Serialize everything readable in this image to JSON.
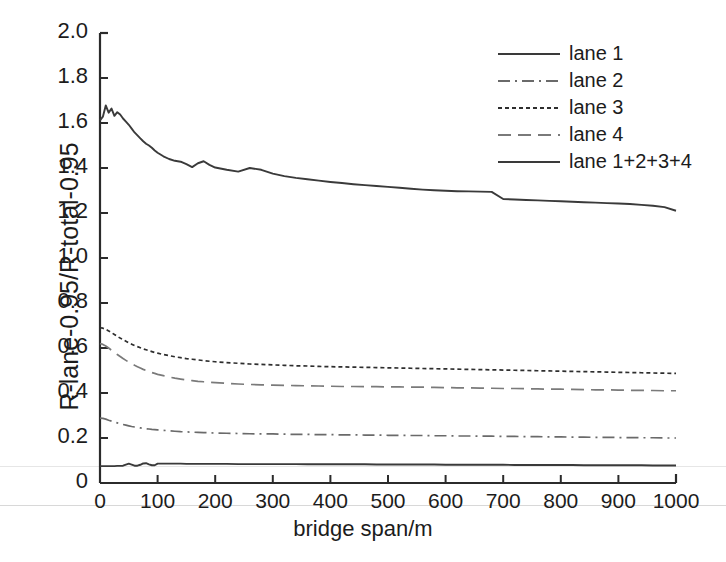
{
  "chart_data": {
    "type": "line",
    "title": "",
    "xlabel": "bridge span/m",
    "ylabel": "R-lane-0.95/R-total-0.95",
    "xlim": [
      0,
      1000
    ],
    "ylim": [
      0,
      2.0
    ],
    "grid": false,
    "legend_position": "upper right",
    "xticks": [
      "0",
      "100",
      "200",
      "300",
      "400",
      "500",
      "600",
      "700",
      "800",
      "900",
      "1000"
    ],
    "xtick_values": [
      0,
      100,
      200,
      300,
      400,
      500,
      600,
      700,
      800,
      900,
      1000
    ],
    "yticks": [
      "0",
      "0.2",
      "0.4",
      "0.6",
      "0.8",
      "1.0",
      "1.2",
      "1.4",
      "1.6",
      "1.8",
      "2.0"
    ],
    "ytick_values": [
      0,
      0.2,
      0.4,
      0.6,
      0.8,
      1.0,
      1.2,
      1.4,
      1.6,
      1.8,
      2.0
    ],
    "x": [
      0,
      5,
      10,
      15,
      20,
      25,
      30,
      35,
      40,
      45,
      50,
      55,
      60,
      65,
      70,
      75,
      80,
      85,
      90,
      95,
      100,
      110,
      120,
      130,
      140,
      150,
      160,
      170,
      180,
      190,
      200,
      220,
      240,
      260,
      280,
      300,
      320,
      340,
      360,
      380,
      400,
      420,
      440,
      460,
      480,
      500,
      520,
      540,
      560,
      580,
      600,
      620,
      640,
      660,
      680,
      700,
      720,
      740,
      760,
      780,
      800,
      820,
      840,
      860,
      880,
      900,
      920,
      940,
      960,
      980,
      1000
    ],
    "series": [
      {
        "name": "lane 1",
        "style": "solid",
        "color": "#3a3a3a",
        "values": [
          0.075,
          0.075,
          0.075,
          0.075,
          0.075,
          0.075,
          0.076,
          0.076,
          0.077,
          0.082,
          0.086,
          0.082,
          0.077,
          0.077,
          0.081,
          0.087,
          0.088,
          0.083,
          0.079,
          0.079,
          0.086,
          0.086,
          0.086,
          0.086,
          0.086,
          0.085,
          0.085,
          0.085,
          0.085,
          0.085,
          0.085,
          0.085,
          0.084,
          0.084,
          0.084,
          0.084,
          0.084,
          0.084,
          0.083,
          0.083,
          0.083,
          0.083,
          0.083,
          0.083,
          0.082,
          0.082,
          0.082,
          0.082,
          0.082,
          0.082,
          0.081,
          0.081,
          0.081,
          0.081,
          0.081,
          0.081,
          0.08,
          0.08,
          0.08,
          0.08,
          0.08,
          0.08,
          0.079,
          0.079,
          0.079,
          0.079,
          0.079,
          0.079,
          0.078,
          0.078,
          0.078
        ]
      },
      {
        "name": "lane 2",
        "style": "dashdot",
        "color": "#6a6a6a",
        "values": [
          0.288,
          0.287,
          0.284,
          0.279,
          0.275,
          0.271,
          0.267,
          0.263,
          0.26,
          0.257,
          0.254,
          0.251,
          0.249,
          0.247,
          0.245,
          0.243,
          0.241,
          0.24,
          0.238,
          0.237,
          0.236,
          0.234,
          0.232,
          0.23,
          0.228,
          0.227,
          0.226,
          0.225,
          0.224,
          0.223,
          0.222,
          0.221,
          0.22,
          0.219,
          0.218,
          0.218,
          0.217,
          0.216,
          0.216,
          0.215,
          0.215,
          0.214,
          0.214,
          0.213,
          0.213,
          0.212,
          0.212,
          0.211,
          0.211,
          0.21,
          0.21,
          0.209,
          0.209,
          0.208,
          0.208,
          0.207,
          0.207,
          0.206,
          0.206,
          0.205,
          0.205,
          0.204,
          0.204,
          0.203,
          0.203,
          0.202,
          0.202,
          0.201,
          0.201,
          0.2,
          0.2
        ]
      },
      {
        "name": "lane 3",
        "style": "dotted",
        "color": "#2e2e2e",
        "values": [
          0.69,
          0.688,
          0.683,
          0.676,
          0.668,
          0.66,
          0.652,
          0.644,
          0.637,
          0.63,
          0.623,
          0.617,
          0.611,
          0.606,
          0.601,
          0.596,
          0.592,
          0.588,
          0.584,
          0.58,
          0.577,
          0.571,
          0.566,
          0.561,
          0.557,
          0.553,
          0.55,
          0.547,
          0.544,
          0.541,
          0.539,
          0.535,
          0.532,
          0.529,
          0.527,
          0.525,
          0.523,
          0.521,
          0.52,
          0.518,
          0.517,
          0.516,
          0.515,
          0.514,
          0.513,
          0.512,
          0.511,
          0.51,
          0.509,
          0.508,
          0.507,
          0.506,
          0.505,
          0.504,
          0.503,
          0.502,
          0.501,
          0.5,
          0.499,
          0.498,
          0.497,
          0.496,
          0.495,
          0.494,
          0.493,
          0.492,
          0.491,
          0.49,
          0.489,
          0.488,
          0.487
        ]
      },
      {
        "name": "lane 4",
        "style": "dashed",
        "color": "#7a7a7a",
        "values": [
          0.62,
          0.616,
          0.609,
          0.6,
          0.59,
          0.58,
          0.571,
          0.562,
          0.553,
          0.545,
          0.537,
          0.53,
          0.523,
          0.517,
          0.511,
          0.505,
          0.5,
          0.495,
          0.491,
          0.487,
          0.483,
          0.477,
          0.471,
          0.466,
          0.462,
          0.458,
          0.455,
          0.452,
          0.45,
          0.448,
          0.446,
          0.443,
          0.44,
          0.438,
          0.436,
          0.435,
          0.434,
          0.433,
          0.432,
          0.431,
          0.43,
          0.429,
          0.429,
          0.428,
          0.428,
          0.427,
          0.427,
          0.426,
          0.426,
          0.425,
          0.424,
          0.423,
          0.423,
          0.422,
          0.421,
          0.42,
          0.42,
          0.419,
          0.418,
          0.417,
          0.417,
          0.416,
          0.415,
          0.414,
          0.414,
          0.413,
          0.412,
          0.412,
          0.411,
          0.41,
          0.41
        ]
      },
      {
        "name": "lane 1+2+3+4",
        "style": "solid",
        "color": "#3a3a3a",
        "values": [
          1.612,
          1.628,
          1.678,
          1.646,
          1.664,
          1.632,
          1.648,
          1.638,
          1.62,
          1.606,
          1.592,
          1.575,
          1.558,
          1.545,
          1.532,
          1.519,
          1.508,
          1.5,
          1.49,
          1.478,
          1.468,
          1.452,
          1.44,
          1.432,
          1.428,
          1.417,
          1.404,
          1.421,
          1.43,
          1.414,
          1.402,
          1.392,
          1.384,
          1.4,
          1.392,
          1.375,
          1.364,
          1.356,
          1.35,
          1.344,
          1.338,
          1.333,
          1.328,
          1.324,
          1.32,
          1.316,
          1.312,
          1.308,
          1.304,
          1.301,
          1.299,
          1.297,
          1.296,
          1.295,
          1.294,
          1.262,
          1.26,
          1.258,
          1.256,
          1.254,
          1.252,
          1.25,
          1.248,
          1.246,
          1.244,
          1.242,
          1.24,
          1.236,
          1.232,
          1.226,
          1.21
        ]
      }
    ]
  },
  "legend": {
    "items": [
      {
        "label": "lane 1",
        "style": "solid"
      },
      {
        "label": "lane 2",
        "style": "dashdot"
      },
      {
        "label": "lane 3",
        "style": "dotted"
      },
      {
        "label": "lane 4",
        "style": "dashed"
      },
      {
        "label": "lane 1+2+3+4",
        "style": "solid"
      }
    ]
  },
  "axes": {
    "x_title": "bridge span/m",
    "y_title": "R-lane-0.95/R-total-0.95"
  },
  "colors": {
    "axis": "#2b2b2b",
    "text": "#1c1c1c",
    "background": "#ffffff"
  }
}
